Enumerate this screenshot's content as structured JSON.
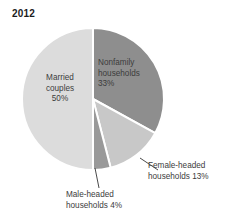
{
  "chart_data": {
    "type": "pie",
    "title": "2012",
    "xlabel": "",
    "ylabel": "",
    "legend_position": "none",
    "grid": false,
    "units": "percent",
    "categories": [
      "Nonfamily households",
      "Female-headed households",
      "Male-headed households",
      "Married couples"
    ],
    "values": [
      33,
      13,
      4,
      50
    ],
    "slices": [
      {
        "name": "Nonfamily households",
        "value": 33,
        "value_label": "33%",
        "label_text": "Nonfamily\nhouseholds\n33%",
        "color": "#8e8e8e",
        "label_placement": "inside",
        "start_angle_deg": 0,
        "end_angle_deg": 118.8
      },
      {
        "name": "Female-headed households",
        "value": 13,
        "value_label": "13%",
        "label_text": "Female-headed\nhouseholds 13%",
        "color": "#c8c8c8",
        "label_placement": "outside",
        "start_angle_deg": 118.8,
        "end_angle_deg": 165.6
      },
      {
        "name": "Male-headed households",
        "value": 4,
        "value_label": "4%",
        "label_text": "Male-headed\nhouseholds 4%",
        "color": "#999999",
        "label_placement": "outside",
        "start_angle_deg": 165.6,
        "end_angle_deg": 180.0
      },
      {
        "name": "Married couples",
        "value": 50,
        "value_label": "50%",
        "label_text": "Married\ncouples\n50%",
        "color": "#dcdcdc",
        "label_placement": "inside",
        "start_angle_deg": 180.0,
        "end_angle_deg": 360.0
      }
    ],
    "separator_color": "#ffffff",
    "leader_line_color": "#4a4a4a",
    "background_color": "#ffffff",
    "text_color": "#3c3c3c"
  }
}
